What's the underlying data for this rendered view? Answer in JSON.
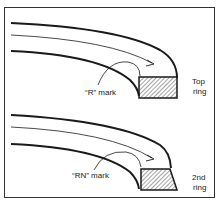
{
  "figure": {
    "panels": [
      {
        "id": "top",
        "mark_label": "“R” mark",
        "ring_label_line1": "Top",
        "ring_label_line2": "ring",
        "cross_section": "rectangle"
      },
      {
        "id": "second",
        "mark_label": "“RN” mark",
        "ring_label_line1": "2nd",
        "ring_label_line2": "ring",
        "cross_section": "tapered"
      }
    ],
    "colors": {
      "line": "#1a1a1a",
      "frame": "#333333",
      "background": "#ffffff"
    }
  }
}
